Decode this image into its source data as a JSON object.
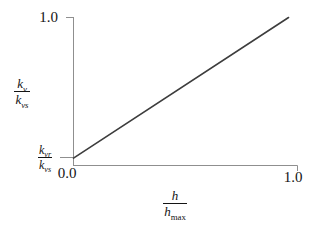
{
  "chart_data": {
    "type": "line",
    "title": "",
    "xlabel": "h / h_max",
    "ylabel": "k_v / k_vs",
    "xlim": [
      0.0,
      1.0
    ],
    "ylim": [
      0.0,
      1.0
    ],
    "x_ticks": [
      "0.0",
      "1.0"
    ],
    "y_ticks": [
      "1.0"
    ],
    "grid": false,
    "legend": false,
    "series": [
      {
        "name": "kv-ratio-vs-depth-ratio",
        "points": [
          [
            0.0,
            0.05
          ],
          [
            0.96,
            1.0
          ]
        ]
      }
    ],
    "annotations": [
      {
        "text": "k_vr / k_vs",
        "position": "y-intercept",
        "x": 0.0,
        "y": 0.05
      }
    ]
  },
  "labels": {
    "y_axis": {
      "num_base": "k",
      "num_sub": "v",
      "den_base": "k",
      "den_sub": "vs"
    },
    "intercept": {
      "num_base": "k",
      "num_sub": "vr",
      "den_base": "k",
      "den_sub": "vs"
    },
    "x_axis": {
      "num_base": "h",
      "den_base": "h",
      "den_sub": "max"
    },
    "ticks": {
      "y_max": "1.0",
      "x_min": "0.0",
      "x_max": "1.0"
    }
  },
  "colors": {
    "background": "#ffffff",
    "axis": "#8f8f8f",
    "line": "#3d3d3d",
    "text": "#141414"
  }
}
